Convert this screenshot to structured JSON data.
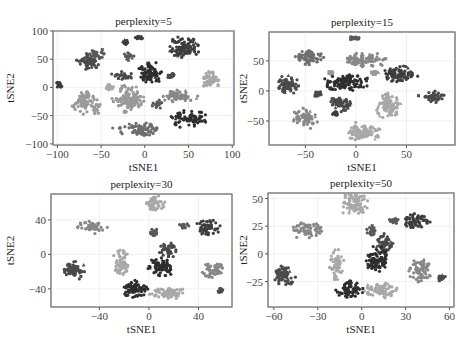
{
  "figure": {
    "layout": "2x2 grid of t-SNE scatter plots",
    "palette": {
      "c1": "#2e2e2e",
      "c2": "#3d3d3d",
      "c3": "#4a4a4a",
      "c4": "#5a5a5a",
      "c5": "#6e6e6e",
      "c6": "#888888",
      "c7": "#9a9a9a",
      "c8": "#a8a8a8"
    }
  },
  "chart_data": [
    {
      "type": "scatter",
      "title": "perplexity=5",
      "xlabel": "tSNE1",
      "ylabel": "tSNE2",
      "xlim": [
        -105,
        102
      ],
      "ylim": [
        -102,
        100
      ],
      "xticks": [
        -100,
        -50,
        0,
        50,
        100
      ],
      "yticks": [
        100,
        50,
        0,
        -50,
        -100
      ],
      "grid": true,
      "legend": "none",
      "box": {
        "x": 53,
        "y": 31,
        "w": 181,
        "h": 114
      },
      "clusters": [
        {
          "cx": -65,
          "cy": 45,
          "rx": 14,
          "ry": 14,
          "color": "c3"
        },
        {
          "cx": -55,
          "cy": 60,
          "rx": 10,
          "ry": 10,
          "color": "c4"
        },
        {
          "cx": -98,
          "cy": 5,
          "rx": 4,
          "ry": 5,
          "color": "c2"
        },
        {
          "cx": -70,
          "cy": -25,
          "rx": 12,
          "ry": 22,
          "color": "c7"
        },
        {
          "cx": -55,
          "cy": -35,
          "rx": 6,
          "ry": 12,
          "color": "c7"
        },
        {
          "cx": -25,
          "cy": 20,
          "rx": 12,
          "ry": 8,
          "color": "c3"
        },
        {
          "cx": -20,
          "cy": -20,
          "rx": 18,
          "ry": 25,
          "color": "c7"
        },
        {
          "cx": -5,
          "cy": -75,
          "rx": 25,
          "ry": 12,
          "color": "c5"
        },
        {
          "cx": -22,
          "cy": 80,
          "rx": 4,
          "ry": 4,
          "color": "c2"
        },
        {
          "cx": -8,
          "cy": 88,
          "rx": 5,
          "ry": 5,
          "color": "c2"
        },
        {
          "cx": -20,
          "cy": 55,
          "rx": 8,
          "ry": 8,
          "color": "c4"
        },
        {
          "cx": 5,
          "cy": 25,
          "rx": 15,
          "ry": 20,
          "color": "c1"
        },
        {
          "cx": 30,
          "cy": 20,
          "rx": 5,
          "ry": 5,
          "color": "c3"
        },
        {
          "cx": 45,
          "cy": 70,
          "rx": 20,
          "ry": 18,
          "color": "c2"
        },
        {
          "cx": 38,
          "cy": -15,
          "rx": 22,
          "ry": 10,
          "color": "c6"
        },
        {
          "cx": 50,
          "cy": -55,
          "rx": 20,
          "ry": 14,
          "color": "c1"
        },
        {
          "cx": 75,
          "cy": 15,
          "rx": 12,
          "ry": 16,
          "color": "c8"
        },
        {
          "cx": 15,
          "cy": -30,
          "rx": 6,
          "ry": 8,
          "color": "c4"
        },
        {
          "cx": -40,
          "cy": 0,
          "rx": 5,
          "ry": 5,
          "color": "c8"
        }
      ]
    },
    {
      "type": "scatter",
      "title": "perplexity=15",
      "xlabel": "tSNE1",
      "ylabel": "tSNE2",
      "xlim": [
        -86,
        98
      ],
      "ylim": [
        -90,
        98
      ],
      "xticks": [
        -50,
        0,
        50
      ],
      "yticks": [
        50,
        0,
        -50
      ],
      "grid": true,
      "legend": "none",
      "box": {
        "x": 269,
        "y": 32,
        "w": 186,
        "h": 113
      },
      "clusters": [
        {
          "cx": -68,
          "cy": 10,
          "rx": 13,
          "ry": 15,
          "color": "c3"
        },
        {
          "cx": -45,
          "cy": 55,
          "rx": 14,
          "ry": 14,
          "color": "c5"
        },
        {
          "cx": -50,
          "cy": -45,
          "rx": 12,
          "ry": 16,
          "color": "c6"
        },
        {
          "cx": -38,
          "cy": -5,
          "rx": 4,
          "ry": 5,
          "color": "c3"
        },
        {
          "cx": -25,
          "cy": 30,
          "rx": 3,
          "ry": 3,
          "color": "c7"
        },
        {
          "cx": -10,
          "cy": 15,
          "rx": 22,
          "ry": 14,
          "color": "c1"
        },
        {
          "cx": -15,
          "cy": -20,
          "rx": 10,
          "ry": 16,
          "color": "c3"
        },
        {
          "cx": -20,
          "cy": -38,
          "rx": 4,
          "ry": 5,
          "color": "c2"
        },
        {
          "cx": -2,
          "cy": 88,
          "rx": 5,
          "ry": 3,
          "color": "c4"
        },
        {
          "cx": 10,
          "cy": 52,
          "rx": 22,
          "ry": 12,
          "color": "c6"
        },
        {
          "cx": 18,
          "cy": 30,
          "rx": 4,
          "ry": 4,
          "color": "c7"
        },
        {
          "cx": 8,
          "cy": -68,
          "rx": 18,
          "ry": 16,
          "color": "c8"
        },
        {
          "cx": 32,
          "cy": -25,
          "rx": 12,
          "ry": 22,
          "color": "c8"
        },
        {
          "cx": 43,
          "cy": 28,
          "rx": 15,
          "ry": 14,
          "color": "c2"
        },
        {
          "cx": 75,
          "cy": -10,
          "rx": 13,
          "ry": 10,
          "color": "c3"
        }
      ]
    },
    {
      "type": "scatter",
      "title": "perplexity=30",
      "xlabel": "tSNE1",
      "ylabel": "tSNE2",
      "xlim": [
        -79,
        67
      ],
      "ylim": [
        -61,
        70
      ],
      "xticks": [
        -40,
        0,
        40
      ],
      "yticks": [
        40,
        0,
        -40
      ],
      "grid": true,
      "legend": "none",
      "box": {
        "x": 51,
        "y": 194,
        "w": 181,
        "h": 113
      },
      "clusters": [
        {
          "cx": -60,
          "cy": -18,
          "rx": 10,
          "ry": 10,
          "color": "c3"
        },
        {
          "cx": -45,
          "cy": 32,
          "rx": 12,
          "ry": 7,
          "color": "c6"
        },
        {
          "cx": -22,
          "cy": -10,
          "rx": 6,
          "ry": 16,
          "color": "c8"
        },
        {
          "cx": -12,
          "cy": -40,
          "rx": 12,
          "ry": 10,
          "color": "c1"
        },
        {
          "cx": 5,
          "cy": 58,
          "rx": 8,
          "ry": 10,
          "color": "c8"
        },
        {
          "cx": 5,
          "cy": 25,
          "rx": 4,
          "ry": 5,
          "color": "c4"
        },
        {
          "cx": 15,
          "cy": 5,
          "rx": 7,
          "ry": 10,
          "color": "c3"
        },
        {
          "cx": 10,
          "cy": -15,
          "rx": 10,
          "ry": 12,
          "color": "c1"
        },
        {
          "cx": 15,
          "cy": -45,
          "rx": 14,
          "ry": 8,
          "color": "c8"
        },
        {
          "cx": 28,
          "cy": 33,
          "rx": 4,
          "ry": 3,
          "color": "c4"
        },
        {
          "cx": 48,
          "cy": 32,
          "rx": 10,
          "ry": 9,
          "color": "c2"
        },
        {
          "cx": 52,
          "cy": -18,
          "rx": 10,
          "ry": 10,
          "color": "c6"
        },
        {
          "cx": 58,
          "cy": -42,
          "rx": 3,
          "ry": 3,
          "color": "c3"
        }
      ]
    },
    {
      "type": "scatter",
      "title": "perplexity=50",
      "xlabel": "tSNE1",
      "ylabel": "tSNE2",
      "xlim": [
        -64,
        63
      ],
      "ylim": [
        -48,
        55
      ],
      "xticks": [
        -60,
        -30,
        0,
        30,
        60
      ],
      "yticks": [
        50,
        25,
        0,
        -25
      ],
      "grid": true,
      "legend": "none",
      "box": {
        "x": 268,
        "y": 193,
        "w": 186,
        "h": 114
      },
      "clusters": [
        {
          "cx": -53,
          "cy": -20,
          "rx": 8,
          "ry": 9,
          "color": "c3"
        },
        {
          "cx": -37,
          "cy": 22,
          "rx": 10,
          "ry": 7,
          "color": "c6"
        },
        {
          "cx": -17,
          "cy": -10,
          "rx": 5,
          "ry": 13,
          "color": "c8"
        },
        {
          "cx": -8,
          "cy": -32,
          "rx": 9,
          "ry": 8,
          "color": "c1"
        },
        {
          "cx": -5,
          "cy": 45,
          "rx": 9,
          "ry": 10,
          "color": "c8"
        },
        {
          "cx": 7,
          "cy": 20,
          "rx": 4,
          "ry": 6,
          "color": "c4"
        },
        {
          "cx": 15,
          "cy": 10,
          "rx": 6,
          "ry": 10,
          "color": "c3"
        },
        {
          "cx": 10,
          "cy": -5,
          "rx": 8,
          "ry": 12,
          "color": "c1"
        },
        {
          "cx": 13,
          "cy": -33,
          "rx": 11,
          "ry": 7,
          "color": "c8"
        },
        {
          "cx": 22,
          "cy": 30,
          "rx": 4,
          "ry": 3,
          "color": "c4"
        },
        {
          "cx": 37,
          "cy": 30,
          "rx": 9,
          "ry": 7,
          "color": "c2"
        },
        {
          "cx": 40,
          "cy": -15,
          "rx": 8,
          "ry": 10,
          "color": "c6"
        },
        {
          "cx": 55,
          "cy": -22,
          "rx": 3,
          "ry": 3,
          "color": "c3"
        }
      ]
    }
  ]
}
